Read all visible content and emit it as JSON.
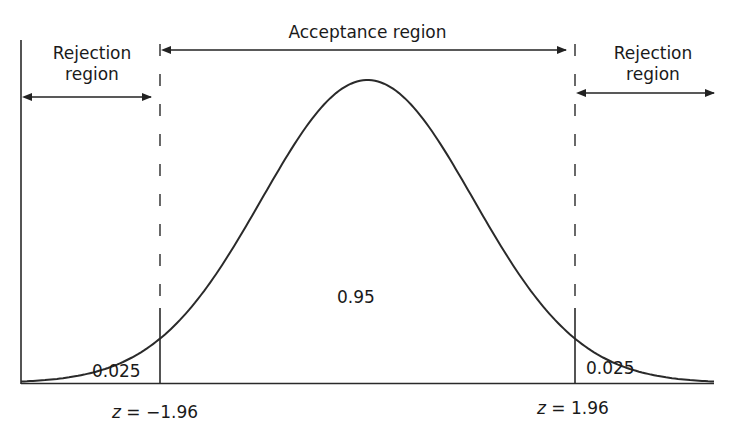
{
  "chart_data": {
    "type": "area",
    "title": "",
    "xlabel": "",
    "ylabel": "",
    "grid": false,
    "critical_values": [
      -1.96,
      1.96
    ],
    "regions": [
      {
        "name": "Rejection region",
        "side": "left",
        "area": 0.025
      },
      {
        "name": "Acceptance region",
        "side": "center",
        "area": 0.95
      },
      {
        "name": "Rejection region",
        "side": "right",
        "area": 0.025
      }
    ],
    "annotations": {
      "left_region_line1": "Rejection",
      "left_region_line2": "region",
      "center_region": "Acceptance region",
      "right_region_line1": "Rejection",
      "right_region_line2": "region",
      "left_tail_area": "0.025",
      "center_area": "0.95",
      "right_tail_area": "0.025",
      "left_z_var": "z",
      "left_z_rest": " = −1.96",
      "right_z_var": "z",
      "right_z_rest": " = 1.96"
    },
    "colors": {
      "line": "#2a2a2a",
      "background": "#ffffff"
    }
  }
}
